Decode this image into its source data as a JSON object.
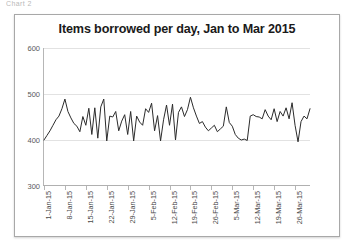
{
  "document": {
    "caption_fragment": "Chart 2"
  },
  "chart_data": {
    "type": "line",
    "title": "Items borrowed per day, Jan to Mar 2015",
    "xlabel": "",
    "ylabel": "",
    "ylim": [
      300,
      600
    ],
    "ytick_values": [
      300,
      400,
      500,
      600
    ],
    "ytick_labels": [
      "300",
      "400",
      "500",
      "600"
    ],
    "grid": true,
    "legend": false,
    "legend_position": "none",
    "series_name": "Items borrowed per day",
    "line_color": "#2b2b2b",
    "x_start_label": "1-Jan-15",
    "x_end_label": "31-Mar-15",
    "xtick_labels": [
      "1-Jan-15",
      "8-Jan-15",
      "15-Jan-15",
      "22-Jan-15",
      "29-Jan-15",
      "5-Feb-15",
      "12-Feb-15",
      "19-Feb-15",
      "26-Feb-15",
      "5-Mar-15",
      "12-Mar-15",
      "19-Mar-15",
      "26-Mar-15"
    ],
    "xtick_indices": [
      0,
      7,
      14,
      21,
      28,
      35,
      42,
      49,
      56,
      63,
      70,
      77,
      84
    ],
    "x_count": 90,
    "values": [
      400,
      410,
      420,
      432,
      444,
      452,
      468,
      489,
      462,
      448,
      436,
      430,
      418,
      451,
      432,
      469,
      412,
      470,
      404,
      472,
      489,
      398,
      452,
      450,
      462,
      420,
      441,
      455,
      412,
      462,
      398,
      452,
      439,
      432,
      468,
      460,
      480,
      420,
      453,
      398,
      444,
      476,
      432,
      478,
      400,
      460,
      472,
      451,
      466,
      493,
      470,
      452,
      436,
      440,
      428,
      420,
      426,
      432,
      418,
      424,
      430,
      472,
      438,
      430,
      412,
      404,
      400,
      402,
      399,
      452,
      455,
      451,
      450,
      446,
      466,
      452,
      444,
      468,
      440,
      462,
      452,
      470,
      446,
      481,
      432,
      396,
      440,
      452,
      446,
      468
    ]
  }
}
